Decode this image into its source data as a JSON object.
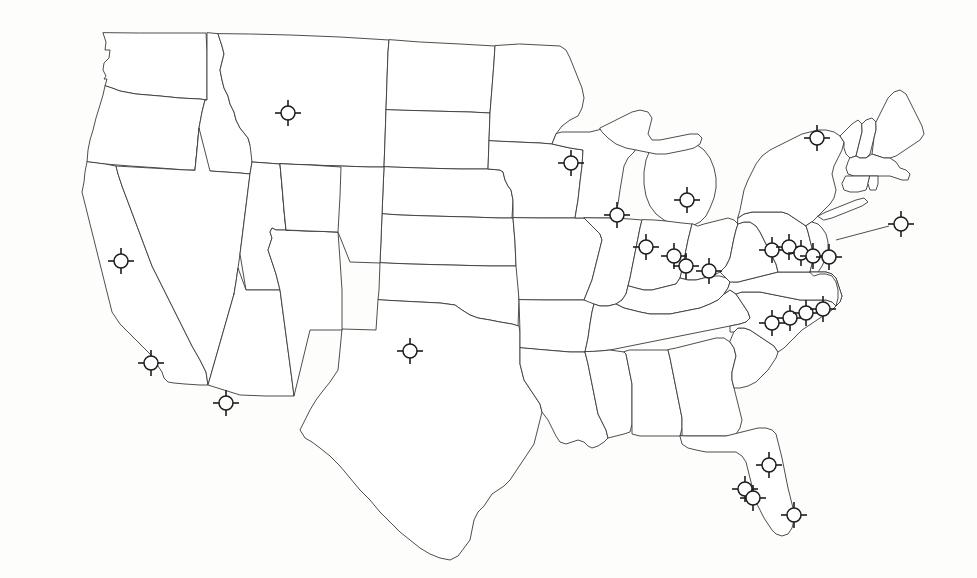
{
  "map": {
    "title": "United States state outline map with plant-site markers",
    "region": "Contiguous United States",
    "background_color": "#fdfdfb",
    "outline_color": "#3a3a3a",
    "marker_color": "#1d1d1d",
    "marker_fill": "#ffffff",
    "marker_symbol_name": "circle-with-four-radial-ticks",
    "marker_count": 26,
    "marker_radius_px": 7,
    "tick_inner_px": 5,
    "tick_outer_px": 13,
    "projection_note": "Albers-like conic, 977x578 canvas"
  },
  "markers": [
    {
      "id": "m01",
      "label": "marker-idaho-montana",
      "x": 288,
      "y": 113,
      "region": "Montana / Idaho border"
    },
    {
      "id": "m02",
      "label": "marker-nevada",
      "x": 121,
      "y": 261,
      "region": "Nevada"
    },
    {
      "id": "m03",
      "label": "marker-southern-california",
      "x": 151,
      "y": 363,
      "region": "Southern California"
    },
    {
      "id": "m04",
      "label": "marker-arizona",
      "x": 226,
      "y": 403,
      "region": "Arizona"
    },
    {
      "id": "m05",
      "label": "marker-oklahoma-panhandle",
      "x": 410,
      "y": 351,
      "region": "Oklahoma panhandle"
    },
    {
      "id": "m06",
      "label": "marker-minnesota",
      "x": 571,
      "y": 163,
      "region": "Minnesota"
    },
    {
      "id": "m07",
      "label": "marker-wisconsin-illinois",
      "x": 617,
      "y": 215,
      "region": "Wisconsin / Illinois"
    },
    {
      "id": "m08",
      "label": "marker-michigan",
      "x": 687,
      "y": 200,
      "region": "Michigan"
    },
    {
      "id": "m09",
      "label": "marker-illinois",
      "x": 646,
      "y": 247,
      "region": "Illinois"
    },
    {
      "id": "m10",
      "label": "marker-indiana-west",
      "x": 674,
      "y": 256,
      "region": "Indiana"
    },
    {
      "id": "m11",
      "label": "marker-indiana-east",
      "x": 686,
      "y": 266,
      "region": "Indiana / Ohio"
    },
    {
      "id": "m12",
      "label": "marker-ohio-south",
      "x": 709,
      "y": 271,
      "region": "Ohio / Kentucky"
    },
    {
      "id": "m13",
      "label": "marker-upstate-new-york",
      "x": 817,
      "y": 138,
      "region": "Upstate New York"
    },
    {
      "id": "m14",
      "label": "marker-pennsylvania-west",
      "x": 772,
      "y": 250,
      "region": "Pennsylvania"
    },
    {
      "id": "m15",
      "label": "marker-pennsylvania-mid",
      "x": 789,
      "y": 247,
      "region": "Pennsylvania"
    },
    {
      "id": "m16",
      "label": "marker-pennsylvania-east",
      "x": 801,
      "y": 253,
      "region": "Pennsylvania"
    },
    {
      "id": "m17",
      "label": "marker-new-jersey",
      "x": 813,
      "y": 256,
      "region": "New Jersey"
    },
    {
      "id": "m18",
      "label": "marker-maryland-delaware",
      "x": 829,
      "y": 257,
      "region": "Maryland / Delaware"
    },
    {
      "id": "m19",
      "label": "marker-offshore-atlantic",
      "x": 901,
      "y": 224,
      "region": "Offshore callout (Atlantic)"
    },
    {
      "id": "m20",
      "label": "marker-virginia-west",
      "x": 772,
      "y": 323,
      "region": "Virginia"
    },
    {
      "id": "m21",
      "label": "marker-virginia-mid",
      "x": 790,
      "y": 318,
      "region": "Virginia"
    },
    {
      "id": "m22",
      "label": "marker-virginia-east",
      "x": 806,
      "y": 313,
      "region": "Virginia"
    },
    {
      "id": "m23",
      "label": "marker-virginia-coast",
      "x": 823,
      "y": 309,
      "region": "Virginia coast"
    },
    {
      "id": "m24",
      "label": "marker-florida-north",
      "x": 769,
      "y": 465,
      "region": "Northern Florida"
    },
    {
      "id": "m25",
      "label": "marker-florida-gulf-upper",
      "x": 745,
      "y": 489,
      "region": "Florida Gulf coast"
    },
    {
      "id": "m26",
      "label": "marker-florida-gulf-lower",
      "x": 753,
      "y": 498,
      "region": "Florida Gulf coast"
    },
    {
      "id": "m27",
      "label": "marker-florida-south",
      "x": 794,
      "y": 515,
      "region": "Southern Florida"
    }
  ],
  "leaders": [
    {
      "id": "l01",
      "label": "leader-offshore-to-delmarva",
      "x1": 889,
      "y1": 226,
      "x2": 836,
      "y2": 240
    }
  ],
  "counts": {
    "west": 4,
    "plains": 1,
    "midwest": 7,
    "northeast": 7,
    "southeast_atlantic": 4,
    "florida": 4
  }
}
